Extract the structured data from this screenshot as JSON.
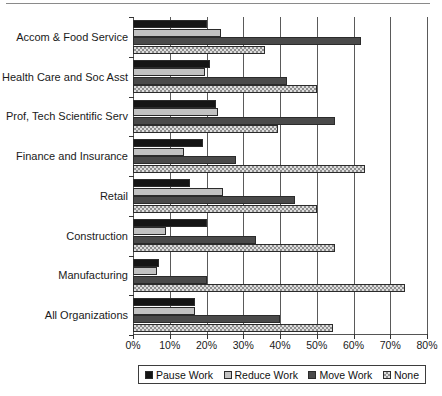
{
  "chart_data": {
    "type": "bar",
    "orientation": "horizontal",
    "title": "",
    "xlabel": "",
    "ylabel": "",
    "xlim": [
      0,
      80
    ],
    "xtick_labels": [
      "0%",
      "10%",
      "20%",
      "30%",
      "40%",
      "50%",
      "60%",
      "70%",
      "80%"
    ],
    "xtick_values": [
      0,
      10,
      20,
      30,
      40,
      50,
      60,
      70,
      80
    ],
    "grid": "vertical",
    "legend_position": "bottom",
    "categories": [
      "Accom & Food Service",
      "Health Care and Soc Asst",
      "Prof, Tech Scientific Serv",
      "Finance and Insurance",
      "Retail",
      "Construction",
      "Manufacturing",
      "All Organizations"
    ],
    "series": [
      {
        "name": "Pause Work",
        "color": "#151515",
        "values": [
          20,
          21,
          22.5,
          19,
          15.5,
          20,
          7,
          17
        ]
      },
      {
        "name": "Reduce Work",
        "color": "#c2c2c2",
        "values": [
          24,
          19.5,
          23,
          14,
          24.5,
          9,
          6.5,
          17
        ]
      },
      {
        "name": "Move Work",
        "color": "#4a4a4a",
        "values": [
          62,
          42,
          55,
          28,
          44,
          33.5,
          20,
          40
        ]
      },
      {
        "name": "None",
        "color": "#dedede",
        "values": [
          36,
          50,
          39.5,
          63,
          50,
          55,
          74,
          54.5
        ]
      }
    ]
  },
  "legend": {
    "items": [
      {
        "label": "Pause Work"
      },
      {
        "label": "Reduce Work"
      },
      {
        "label": "Move Work"
      },
      {
        "label": "None"
      }
    ]
  }
}
